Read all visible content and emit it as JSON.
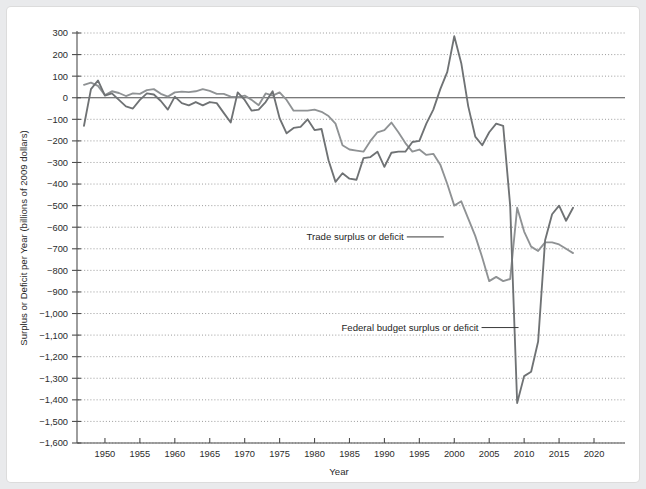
{
  "figure": {
    "background_color": "#ffffff",
    "page_background_color": "#e9eaec"
  },
  "chart_data": {
    "type": "line",
    "title": "",
    "subtitle": "",
    "xlabel": "Year",
    "ylabel": "Surplus or Deficit per Year (billions of 2009 dollars)",
    "xlim": [
      1946,
      2021
    ],
    "ylim": [
      -1600,
      300
    ],
    "grid": true,
    "gridlines": "horizontal-dotted",
    "legend_position": "inline-annotations",
    "x_ticks": [
      1950,
      1955,
      1960,
      1965,
      1970,
      1975,
      1980,
      1985,
      1990,
      1995,
      2000,
      2005,
      2010,
      2015,
      2020
    ],
    "x_tick_labels": [
      "1950",
      "1955",
      "1960",
      "1965",
      "1970",
      "1975",
      "1980",
      "1985",
      "1990",
      "1995",
      "2000",
      "2005",
      "2010",
      "2015",
      "2020"
    ],
    "y_ticks": [
      300,
      200,
      100,
      0,
      -100,
      -200,
      -300,
      -400,
      -500,
      -600,
      -700,
      -800,
      -900,
      -1000,
      -1100,
      -1200,
      -1300,
      -1400,
      -1500,
      -1600
    ],
    "y_tick_labels": [
      "300",
      "200",
      "100",
      "0",
      "−100",
      "−200",
      "−300",
      "−400",
      "−500",
      "−600",
      "−700",
      "−800",
      "−900",
      "−1,000",
      "−1,100",
      "−1,200",
      "−1,300",
      "−1,400",
      "−1,500",
      "−1,600"
    ],
    "zero_reference_line": 0,
    "series": [
      {
        "name": "Trade surplus or deficit",
        "color": "#8f9294",
        "annotation_label": "Trade surplus or deficit",
        "x": [
          1947,
          1948,
          1949,
          1950,
          1951,
          1952,
          1953,
          1954,
          1955,
          1956,
          1957,
          1958,
          1959,
          1960,
          1961,
          1962,
          1963,
          1964,
          1965,
          1966,
          1967,
          1968,
          1969,
          1970,
          1971,
          1972,
          1973,
          1974,
          1975,
          1976,
          1977,
          1978,
          1979,
          1980,
          1981,
          1982,
          1983,
          1984,
          1985,
          1986,
          1987,
          1988,
          1989,
          1990,
          1991,
          1992,
          1993,
          1994,
          1995,
          1996,
          1997,
          1998,
          1999,
          2000,
          2001,
          2002,
          2003,
          2004,
          2005,
          2006,
          2007,
          2008,
          2009,
          2010,
          2011,
          2012,
          2013,
          2014,
          2015,
          2016,
          2017
        ],
        "y": [
          60,
          70,
          55,
          12,
          30,
          22,
          8,
          20,
          18,
          35,
          40,
          18,
          5,
          25,
          28,
          26,
          30,
          40,
          32,
          18,
          18,
          5,
          3,
          10,
          -10,
          -35,
          20,
          10,
          25,
          -10,
          -60,
          -60,
          -60,
          -55,
          -65,
          -85,
          -120,
          -220,
          -240,
          -245,
          -250,
          -200,
          -160,
          -150,
          -115,
          -160,
          -210,
          -250,
          -240,
          -265,
          -260,
          -310,
          -400,
          -500,
          -480,
          -560,
          -640,
          -740,
          -850,
          -830,
          -850,
          -840,
          -510,
          -620,
          -690,
          -710,
          -670,
          -670,
          -680,
          -700,
          -720
        ]
      },
      {
        "name": "Federal budget surplus or deficit",
        "color": "#6f7274",
        "annotation_label": "Federal budget surplus or deficit",
        "x": [
          1947,
          1948,
          1949,
          1950,
          1951,
          1952,
          1953,
          1954,
          1955,
          1956,
          1957,
          1958,
          1959,
          1960,
          1961,
          1962,
          1963,
          1964,
          1965,
          1966,
          1967,
          1968,
          1969,
          1970,
          1971,
          1972,
          1973,
          1974,
          1975,
          1976,
          1977,
          1978,
          1979,
          1980,
          1981,
          1982,
          1983,
          1984,
          1985,
          1986,
          1987,
          1988,
          1989,
          1990,
          1991,
          1992,
          1993,
          1994,
          1995,
          1996,
          1997,
          1998,
          1999,
          2000,
          2001,
          2002,
          2003,
          2004,
          2005,
          2006,
          2007,
          2008,
          2009,
          2010,
          2011,
          2012,
          2013,
          2014,
          2015,
          2016,
          2017
        ],
        "y": [
          -130,
          40,
          80,
          10,
          20,
          -10,
          -40,
          -50,
          -10,
          20,
          15,
          -15,
          -55,
          5,
          -25,
          -35,
          -20,
          -35,
          -20,
          -25,
          -70,
          -115,
          25,
          -10,
          -60,
          -55,
          -20,
          30,
          -95,
          -165,
          -140,
          -135,
          -100,
          -150,
          -145,
          -290,
          -390,
          -350,
          -375,
          -380,
          -280,
          -275,
          -250,
          -320,
          -255,
          -250,
          -250,
          -205,
          -200,
          -120,
          -55,
          40,
          120,
          285,
          160,
          -40,
          -180,
          -220,
          -160,
          -120,
          -130,
          -500,
          -1415,
          -1290,
          -1270,
          -1130,
          -660,
          -540,
          -500,
          -570,
          -510
        ]
      }
    ],
    "annotations": [
      {
        "text": "Trade surplus or deficit",
        "x_year": 1998.5,
        "y_value": -645
      },
      {
        "text": "Federal budget surplus or deficit",
        "x_year": 2009.2,
        "y_value": -1065
      }
    ]
  }
}
